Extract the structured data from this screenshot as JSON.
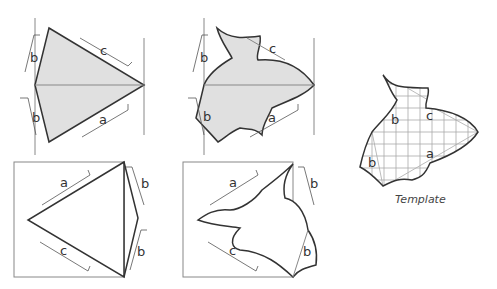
{
  "diagram": {
    "type": "tessellation-template-construction",
    "panels": [
      {
        "id": "triangle-split",
        "labels": [
          "b",
          "b",
          "c",
          "a"
        ]
      },
      {
        "id": "curved-split",
        "labels": [
          "b",
          "b",
          "c",
          "a"
        ]
      },
      {
        "id": "triangle-boxed",
        "labels": [
          "a",
          "b",
          "c",
          "b"
        ]
      },
      {
        "id": "curved-boxed",
        "labels": [
          "a",
          "b",
          "c",
          "b"
        ]
      },
      {
        "id": "template",
        "labels": [
          "b",
          "c",
          "b",
          "a"
        ]
      }
    ],
    "caption": "Template",
    "colors": {
      "fill": "#e0e0e0",
      "stroke": "#333333",
      "guide": "#888888"
    }
  },
  "labels": {
    "p1_b_top": "b",
    "p1_b_bot": "b",
    "p1_c": "c",
    "p1_a": "a",
    "p2_b_top": "b",
    "p2_b_bot": "b",
    "p2_c": "c",
    "p2_a": "a",
    "p3_a": "a",
    "p3_b_top": "b",
    "p3_c": "c",
    "p3_b_bot": "b",
    "p4_a": "a",
    "p4_b_top": "b",
    "p4_c": "c",
    "p4_b_bot": "b",
    "t_b1": "b",
    "t_c": "c",
    "t_b2": "b",
    "t_a": "a"
  },
  "caption": "Template"
}
